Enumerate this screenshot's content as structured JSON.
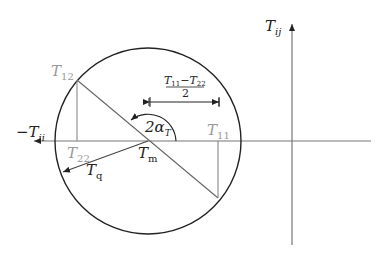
{
  "diagram": {
    "colors": {
      "circle": "#222222",
      "axis": "#777777",
      "construction": "#888888",
      "label_dark": "#222222",
      "label_gray": "#999999"
    },
    "labels": {
      "vertical_axis": {
        "main": "T",
        "sub": "ij"
      },
      "horizontal_axis": {
        "main": "−T",
        "sub": "ii"
      },
      "t12": {
        "main": "T",
        "sub": "12"
      },
      "t22": {
        "main": "T",
        "sub": "22"
      },
      "t11": {
        "main": "T",
        "sub": "11"
      },
      "tm": {
        "main": "T",
        "sub": "m"
      },
      "tq": {
        "main": "T",
        "sub": "q"
      },
      "angle": {
        "main": "2α",
        "sub": "T"
      },
      "half_diff_numerator": {
        "a": "T",
        "a_sub": "11",
        "op": "−",
        "b": "T",
        "b_sub": "22"
      },
      "half_diff_denominator": "2"
    },
    "geometry": {
      "center": [
        148,
        141
      ],
      "radius": 93,
      "point_12": [
        77,
        80
      ],
      "point_11": [
        218,
        198
      ],
      "vertical_axis_x": 292
    }
  }
}
